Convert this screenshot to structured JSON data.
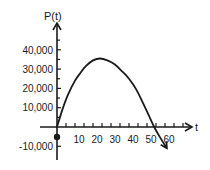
{
  "chart_data": {
    "type": "line",
    "title": "",
    "xlabel": "t",
    "ylabel": "P(t)",
    "x_ticks": [
      10,
      20,
      30,
      40,
      50,
      60
    ],
    "x_tick_labels": [
      "10",
      "20",
      "30",
      "40",
      "50",
      "60"
    ],
    "y_ticks": [
      -10000,
      10000,
      20000,
      30000,
      40000
    ],
    "y_tick_labels": [
      "-10,000",
      "10,000",
      "20,000",
      "30,000",
      "40,000"
    ],
    "xlim": [
      0,
      70
    ],
    "ylim": [
      -15000,
      48000
    ],
    "grid": false,
    "legend": null,
    "series": [
      {
        "name": "P(t)",
        "x": [
          0,
          3,
          6,
          10,
          13,
          16,
          20,
          24,
          28,
          32,
          36,
          40,
          44,
          48,
          51,
          54,
          57,
          61
        ],
        "y": [
          0,
          9000,
          16500,
          24000,
          28000,
          31500,
          34500,
          35500,
          34500,
          32500,
          29000,
          25000,
          19500,
          12000,
          6000,
          0,
          -5000,
          -11000
        ]
      }
    ],
    "annotations": [
      {
        "type": "point",
        "x": 0,
        "y": -5000,
        "label": ""
      },
      {
        "type": "arrow",
        "at": "end-of-curve"
      }
    ]
  },
  "colors": {
    "axis": "#1a1a1a",
    "curve": "#1a1a1a",
    "background": "#ffffff"
  },
  "labels": {
    "y_axis_title": "P(t)",
    "x_axis_title": "t",
    "y_ticks": [
      "40,000",
      "30,000",
      "20,000",
      "10,000",
      "-10,000"
    ],
    "x_ticks": [
      "10",
      "20",
      "30",
      "40",
      "50",
      "60"
    ]
  }
}
